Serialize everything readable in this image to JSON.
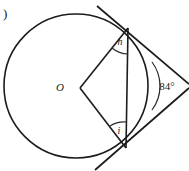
{
  "figure": {
    "part_label": ")",
    "center_label": "O",
    "angle_top_label": "h",
    "angle_bottom_label": "i",
    "external_angle_label": "84°",
    "external_angle_value": 84,
    "colors": {
      "stroke": "#1c1c1c",
      "stroke_light": "#2a2a2a",
      "background": "#ffffff",
      "text": "#1a1a1a"
    },
    "geometry": {
      "circle": {
        "cx": 76,
        "cy": 86,
        "r": 72
      },
      "tangent_point_top": {
        "x": 128,
        "y": 28
      },
      "tangent_point_bottom": {
        "x": 126,
        "y": 148
      },
      "external_point": {
        "x": 186,
        "y": 86
      },
      "tangent_top_start": {
        "x": 98,
        "y": 8
      },
      "tangent_bottom_end": {
        "x": 96,
        "y": 168
      }
    }
  }
}
